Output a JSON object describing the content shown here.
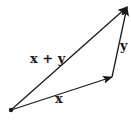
{
  "diagram": {
    "type": "vector-addition-triangle",
    "stroke_color": "#1a1a1a",
    "background": "#ffffff",
    "points": {
      "origin": [
        11,
        110
      ],
      "x_end": [
        112,
        77
      ],
      "sum_end": [
        127,
        7
      ]
    },
    "vectors": [
      {
        "name": "x",
        "label": "x",
        "from": "origin",
        "to": "x_end"
      },
      {
        "name": "y",
        "label": "y",
        "from": "x_end",
        "to": "sum_end"
      },
      {
        "name": "x-plus-y",
        "label": "x + y",
        "from": "origin",
        "to": "sum_end"
      }
    ]
  }
}
